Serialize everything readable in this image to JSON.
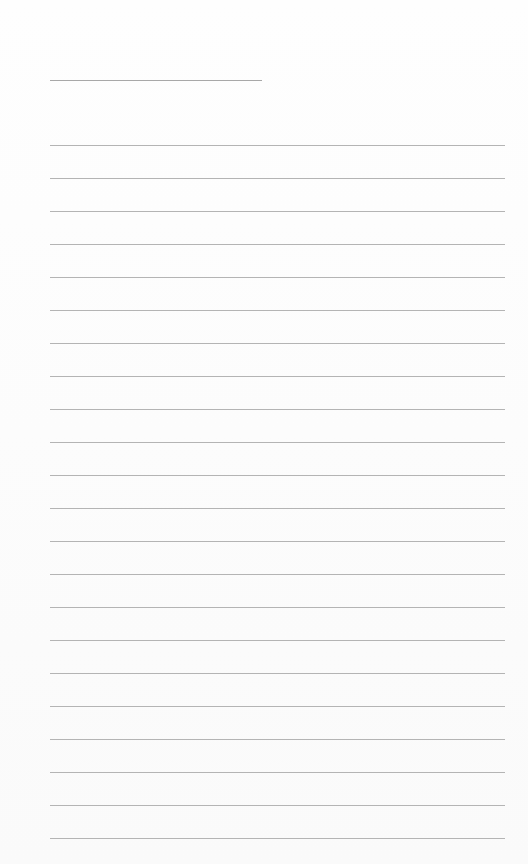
{
  "page": {
    "type": "lined-paper",
    "background": "#fdfdfd",
    "line_color": "#b4b4b4",
    "title_line": {
      "x": 50,
      "y": 80,
      "width": 212
    },
    "rules": {
      "count": 22,
      "start_y": 145,
      "spacing": 33,
      "x": 50,
      "width": 455
    }
  }
}
